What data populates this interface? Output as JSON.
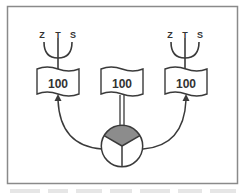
{
  "diagram": {
    "colors": {
      "stroke": "#3a3a3a",
      "frame": "#8a8a8a",
      "shaded_sector": "#8c8c8c",
      "background": "#ffffff"
    },
    "antennas": [
      {
        "labels": [
          "Z",
          "T",
          "S"
        ]
      },
      {
        "labels": [
          "Z",
          "T",
          "S"
        ]
      }
    ],
    "flags": [
      {
        "value": "100",
        "connection": "arrow-from-circle"
      },
      {
        "value": "100",
        "connection": "double-post-from-circle"
      },
      {
        "value": "100",
        "connection": "arrow-from-circle"
      }
    ],
    "hub": {
      "sectors": 3,
      "shaded_sector": "top"
    }
  }
}
